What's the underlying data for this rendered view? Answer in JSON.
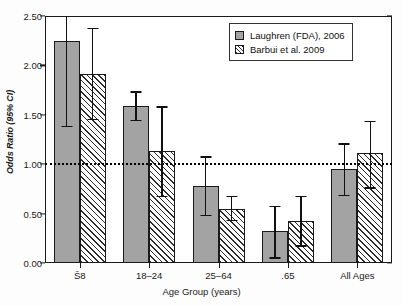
{
  "chart_data": {
    "type": "bar",
    "title": "",
    "xlabel": "Age Group (years)",
    "ylabel": "Odds Ratio (95% CI)",
    "categories": [
      "Š8",
      "18–24",
      "25–64",
      ".65",
      "All Ages"
    ],
    "category_labels_raw": [
      "Ơ18",
      "18–24",
      "25–64",
      ".65",
      "All Ages"
    ],
    "ylim": [
      0.0,
      2.5
    ],
    "yticks": [
      0.0,
      0.5,
      1.0,
      1.5,
      2.0,
      2.5
    ],
    "ytick_labels": [
      "0.00",
      "0.50",
      "1.00",
      "1.50",
      "2.00",
      "2.50"
    ],
    "grid": false,
    "legend_position": "top-right",
    "reference_line": {
      "value": 1.0,
      "style": "dotted"
    },
    "series": [
      {
        "name": "Laughren (FDA), 2006",
        "style": "solid-gray",
        "color": "#a3a3a3",
        "values": [
          2.25,
          1.59,
          0.78,
          0.32,
          0.95
        ],
        "ci_low": [
          1.39,
          1.45,
          0.49,
          0.06,
          0.69
        ],
        "ci_high": [
          2.62,
          1.74,
          1.08,
          0.58,
          1.21
        ],
        "ci_high_clipped": [
          true,
          false,
          false,
          false,
          false
        ]
      },
      {
        "name": "Barbui et al. 2009",
        "style": "hatched",
        "color": "#ffffff",
        "values": [
          1.91,
          1.13,
          0.55,
          0.43,
          1.11
        ],
        "ci_low": [
          1.46,
          0.68,
          0.44,
          0.18,
          0.77
        ],
        "ci_high": [
          2.38,
          1.59,
          0.68,
          0.68,
          1.44
        ],
        "ci_high_clipped": [
          false,
          false,
          false,
          false,
          false
        ]
      }
    ]
  },
  "legend": {
    "items": [
      {
        "label": "Laughren (FDA), 2006",
        "swatch": "solid"
      },
      {
        "label": "Barbui et al. 2009",
        "swatch": "hatch"
      }
    ]
  }
}
